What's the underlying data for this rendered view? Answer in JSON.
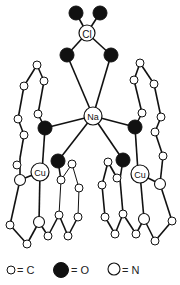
{
  "diagram": {
    "type": "molecular-structure",
    "labels": {
      "chlorine": "Cl",
      "sodium": "Na",
      "copper_left": "Cu",
      "copper_right": "Cu"
    },
    "colors": {
      "carbon": "#ffffff",
      "oxygen": "#111111",
      "nitrogen": "#ffffff",
      "bond": "#111111"
    }
  },
  "legend": {
    "items": [
      {
        "symbol": "small-open-circle",
        "label": "= C"
      },
      {
        "symbol": "filled-circle",
        "label": "= O"
      },
      {
        "symbol": "large-open-circle",
        "label": "= N"
      }
    ]
  }
}
